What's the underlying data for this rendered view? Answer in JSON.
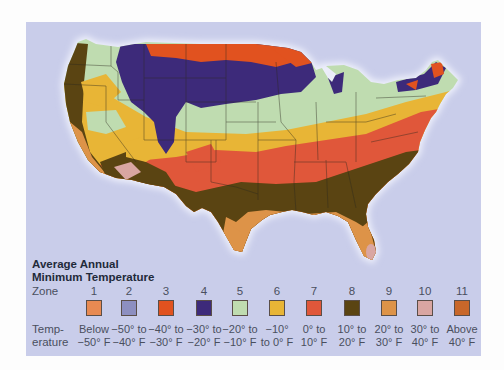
{
  "legend": {
    "title_line1": "Average Annual",
    "title_line2": "Minimum Temperature",
    "zone_label": "Zone",
    "temp_label_line1": "Temp-",
    "temp_label_line2": "erature",
    "zones": [
      {
        "zone": "1",
        "line1": "Below",
        "line2": "−50° F",
        "color": "#e88a52",
        "x": 68
      },
      {
        "zone": "2",
        "line1": "−50° to",
        "line2": "−40° F",
        "color": "#8d8fc0",
        "x": 103
      },
      {
        "zone": "3",
        "line1": "−40° to",
        "line2": "−30° F",
        "color": "#e1521f",
        "x": 140
      },
      {
        "zone": "4",
        "line1": "−30° to",
        "line2": "−20° F",
        "color": "#3d2a7a",
        "x": 178
      },
      {
        "zone": "5",
        "line1": "−20° to",
        "line2": "−10° F",
        "color": "#bfdcb0",
        "x": 214
      },
      {
        "zone": "6",
        "line1": "−10°",
        "line2": "to 0° F",
        "color": "#e8b536",
        "x": 251
      },
      {
        "zone": "7",
        "line1": "0° to",
        "line2": "10° F",
        "color": "#e0573a",
        "x": 288
      },
      {
        "zone": "8",
        "line1": "10° to",
        "line2": "20° F",
        "color": "#5a4412",
        "x": 326
      },
      {
        "zone": "9",
        "line1": "20° to",
        "line2": "30° F",
        "color": "#dd9348",
        "x": 363
      },
      {
        "zone": "10",
        "line1": "30° to",
        "line2": "40° F",
        "color": "#d9a6a2",
        "x": 399
      },
      {
        "zone": "11",
        "line1": "Above",
        "line2": "40° F",
        "color": "#c8672a",
        "x": 436
      }
    ]
  },
  "map": {
    "subject": "Contiguous United States plant hardiness zones",
    "background_color": "#c9cdea"
  }
}
